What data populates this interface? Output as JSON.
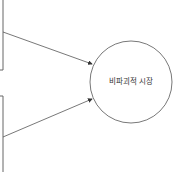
{
  "diagram": {
    "node": {
      "label": "비파괴적 시장",
      "shape": "circle"
    },
    "colors": {
      "stroke": "#555555",
      "text": "#333333",
      "background": "#ffffff"
    }
  }
}
